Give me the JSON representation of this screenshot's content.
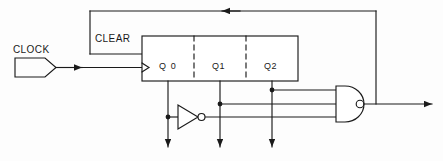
{
  "diagram": {
    "background_color": "#fdfdfd",
    "line_color": "#1a1a1a",
    "labels": {
      "clock": "CLOCK",
      "clear": "CLEAR",
      "q0": "Q 0",
      "q1": "Q1",
      "q2": "Q2"
    },
    "components": {
      "clock_source": "clock-input-terminal",
      "register": "three-stage-register-block",
      "inverter": "inverter-gate",
      "nand": "three-input-nand-gate",
      "feedback": "clear-feedback-wire"
    },
    "outputs": {
      "q0": "Q 0",
      "q1": "Q1",
      "q2": "Q2",
      "nand_out": "nand-output"
    }
  }
}
